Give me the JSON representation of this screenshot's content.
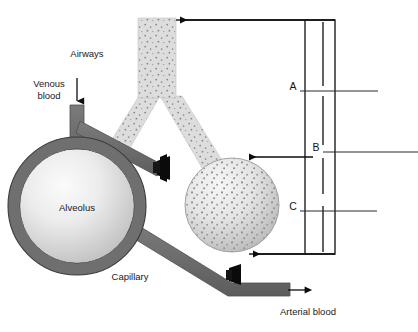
{
  "figure": {
    "background_color": "#ffffff"
  },
  "labels": {
    "airways": "Airways",
    "venous_blood_line1": "Venous",
    "venous_blood_line2": "blood",
    "alveolus": "Alveolus",
    "capillary": "Capillary",
    "arterial_blood": "Arterial blood"
  },
  "brackets": [
    {
      "id": "A",
      "label": "A"
    },
    {
      "id": "B",
      "label": "B"
    },
    {
      "id": "C",
      "label": "C"
    }
  ],
  "colors": {
    "airway_fill": "#d4d4d4",
    "airway_speckle": "#8d8d8d",
    "vessel_fill": "#6e6e6e",
    "vessel_stroke": "#4a4a4a",
    "alveolus_ring": "#707070",
    "alveolus_inner_light": "#f2f2f2",
    "alveolus_inner_dark": "#c0c0c0",
    "clamp": "#0a0a0a",
    "line": "#1f1f1f",
    "text": "#1a1a1a"
  },
  "icons": {
    "venous_inflow": "down-arrow-icon",
    "arterial_outflow": "right-arrow-icon",
    "pointer_a": "left-arrow-icon",
    "pointer_b": "left-arrow-icon",
    "pointer_c": "left-arrow-icon",
    "clamp_upper": "vessel-clamp-icon",
    "clamp_lower": "vessel-clamp-icon"
  }
}
